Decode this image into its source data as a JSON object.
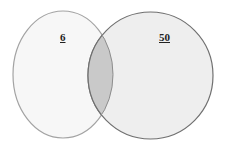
{
  "venn": {
    "left_set": {
      "value": "6",
      "fill": "#f7f7f7",
      "stroke": "#9a9a9a"
    },
    "right_set": {
      "value": "50",
      "fill": "#eeeeee",
      "stroke": "#6e6e6e"
    },
    "intersection": {
      "fill": "#c9c9c9"
    }
  }
}
